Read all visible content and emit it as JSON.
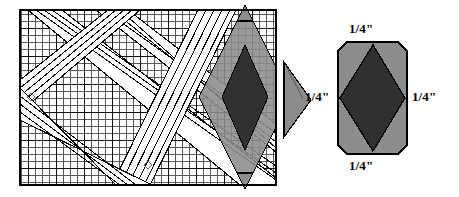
{
  "figure": {
    "type": "quilting-pattern-illustration"
  },
  "cutting_mat": {
    "name": "grid-cutting-mat",
    "bounds": {
      "x": 20,
      "y": 10,
      "width": 256,
      "height": 175
    },
    "fine_cell_px": 7,
    "major_every_cells": 4,
    "fine_line_color": "#3d3d3d",
    "major_line_color": "#1a1a1a",
    "border_color": "#000000",
    "background": "#ffffff",
    "marks": [
      {
        "name": "registration-mark-left",
        "x": 31,
        "y": 97
      },
      {
        "name": "registration-mark-bottom",
        "x": 148,
        "y": 165
      }
    ]
  },
  "strip_bands": {
    "name": "diagonal-strip-bands",
    "description": "Parallel pieced fabric strips crossing the mat diagonally",
    "line_color": "#000000",
    "band_fill": "#ffffff",
    "groups": [
      {
        "name": "band-group-descending",
        "angle_deg": 55
      },
      {
        "name": "band-group-ascending",
        "angle_deg": -55
      }
    ]
  },
  "mat_diamond": {
    "name": "diamond-cut-overlay",
    "outer_fill": "#8c8c8c",
    "inner_fill": "#2b2b2b",
    "vertices": {
      "top": {
        "x": 245,
        "y": 5
      },
      "right": {
        "x": 291,
        "y": 97
      },
      "bottom": {
        "x": 245,
        "y": 189
      },
      "left": {
        "x": 199,
        "y": 97
      }
    },
    "inner_vertices": {
      "top": {
        "x": 245,
        "y": 45
      },
      "right": {
        "x": 268,
        "y": 97
      },
      "bottom": {
        "x": 245,
        "y": 150
      },
      "left": {
        "x": 222,
        "y": 97
      }
    }
  },
  "arrow": {
    "name": "transform-arrow",
    "direction": "right",
    "fill": "#8c8c8c",
    "stroke": "#000000",
    "points": "284,62 311,100 284,137"
  },
  "detail_block": {
    "name": "finished-diamond-block",
    "rect": {
      "x": 338,
      "y": 42,
      "width": 69,
      "height": 112,
      "corner_cut": 9
    },
    "background_fill": "#8c8c8c",
    "diamond_fill": "#303030",
    "stroke": "#000000",
    "diamond_vertices": {
      "top": {
        "x": 373,
        "y": 45
      },
      "right": {
        "x": 405,
        "y": 98
      },
      "bottom": {
        "x": 373,
        "y": 151
      },
      "left": {
        "x": 340,
        "y": 98
      }
    }
  },
  "labels": {
    "seam_allowance_top": "1/4\"",
    "seam_allowance_bottom": "1/4\"",
    "seam_allowance_left": "1/4\"",
    "seam_allowance_right": "1/4\""
  },
  "colors": {
    "gray": "#8c8c8c",
    "dark": "#2b2b2b",
    "detail_dark": "#303030",
    "black": "#000000",
    "white": "#ffffff"
  }
}
